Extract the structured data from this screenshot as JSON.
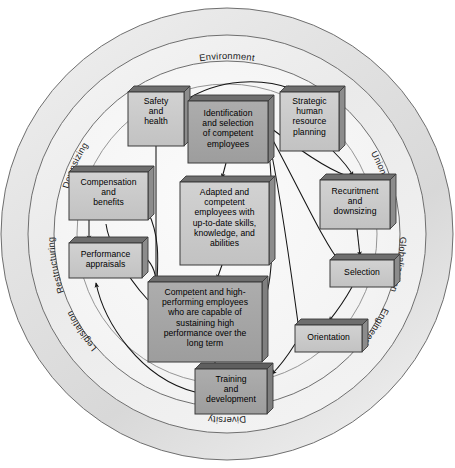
{
  "diagram": {
    "canvas": {
      "width": 455,
      "height": 468
    },
    "colors": {
      "outer_ring_fill": "#e2e2e2",
      "middle_ring_fill": "#ededed",
      "inner_disc_fill": "#f4f4f4",
      "ring_stroke": "#6f6f6f",
      "box_light_fill": "#c9c9c9",
      "box_dark_fill": "#a6a6a6",
      "box_stroke": "#3b3b3b",
      "box_top_face": "#707070",
      "arrow_stroke": "#1a1a1a",
      "text": "#000000",
      "background": "#ffffff"
    },
    "environment_ring": {
      "name": "environment-ring",
      "labels": [
        {
          "id": "environment",
          "text": "Environment",
          "angle_deg": 270,
          "orientation": "horizontal"
        },
        {
          "id": "unions",
          "text": "Unions",
          "angle_deg": 315,
          "orientation": "tangential"
        },
        {
          "id": "globalization",
          "text": "Globalization",
          "angle_deg": 0,
          "orientation": "tangential"
        },
        {
          "id": "engineering",
          "text": "Engineering",
          "angle_deg": 45,
          "orientation": "tangential"
        },
        {
          "id": "diversity",
          "text": "Diversity",
          "angle_deg": 90,
          "orientation": "horizontal"
        },
        {
          "id": "legislation",
          "text": "Legislation",
          "angle_deg": 135,
          "orientation": "tangential"
        },
        {
          "id": "restructuring",
          "text": "Restructuring",
          "angle_deg": 180,
          "orientation": "tangential"
        },
        {
          "id": "downsizing",
          "text": "Downsizing",
          "angle_deg": 225,
          "orientation": "tangential"
        }
      ]
    },
    "boxes": [
      {
        "id": "safety-and-health",
        "name": "box-safety-and-health",
        "lines": [
          "Safety",
          "and",
          "health"
        ],
        "style": "light",
        "x": 128,
        "y": 92,
        "w": 56,
        "h": 54
      },
      {
        "id": "identification-and-selection",
        "name": "box-identification-and-selection",
        "lines": [
          "Identification",
          "and selection",
          "of competent",
          "employees"
        ],
        "style": "dark",
        "x": 188,
        "y": 101,
        "w": 80,
        "h": 62
      },
      {
        "id": "strategic-hr-planning",
        "name": "box-strategic-human-resource-planning",
        "lines": [
          "Strategic",
          "human",
          "resource",
          "planning"
        ],
        "style": "light",
        "x": 280,
        "y": 92,
        "w": 59,
        "h": 59
      },
      {
        "id": "compensation-and-benefits",
        "name": "box-compensation-and-benefits",
        "lines": [
          "Compensation",
          "and",
          "benefits"
        ],
        "style": "light",
        "x": 69,
        "y": 172,
        "w": 79,
        "h": 48
      },
      {
        "id": "adapted-and-competent",
        "name": "box-adapted-and-competent-employees",
        "lines": [
          "Adapted and",
          "competent",
          "employees with",
          "up-to-date skills,",
          "knowledge, and",
          "abilities"
        ],
        "style": "light",
        "x": 180,
        "y": 182,
        "w": 89,
        "h": 83
      },
      {
        "id": "recruitment-and-downsizing",
        "name": "box-recuritment-and-downsizing",
        "lines": [
          "Recuritment",
          "and",
          "downsizing"
        ],
        "style": "light",
        "x": 320,
        "y": 180,
        "w": 70,
        "h": 49
      },
      {
        "id": "performance-appraisals",
        "name": "box-performance-appraisals",
        "lines": [
          "Performance",
          "appraisals"
        ],
        "style": "light",
        "x": 69,
        "y": 243,
        "w": 73,
        "h": 35
      },
      {
        "id": "selection",
        "name": "box-selection",
        "lines": [
          "Selection"
        ],
        "style": "light",
        "x": 330,
        "y": 260,
        "w": 64,
        "h": 27
      },
      {
        "id": "competent-high-performing",
        "name": "box-competent-and-high-performing-employees",
        "lines": [
          "Competent and high-",
          "performing employees",
          "who are capable of",
          "sustaining high",
          "performance over the",
          "long term"
        ],
        "style": "dark",
        "x": 148,
        "y": 282,
        "w": 114,
        "h": 80
      },
      {
        "id": "orientation",
        "name": "box-orientation",
        "lines": [
          "Orientation"
        ],
        "style": "light",
        "x": 295,
        "y": 325,
        "w": 67,
        "h": 27
      },
      {
        "id": "training-and-development",
        "name": "box-training-and-development",
        "lines": [
          "Training",
          "and",
          "development"
        ],
        "style": "dark",
        "x": 195,
        "y": 369,
        "w": 72,
        "h": 45
      }
    ],
    "connections": [
      {
        "id": "c1",
        "from": "safety-and-health",
        "to": "strategic-hr-planning",
        "arrow": true
      },
      {
        "id": "c2",
        "from": "strategic-hr-planning",
        "to": "recruitment-and-downsizing",
        "arrow": true
      },
      {
        "id": "c3",
        "from": "recruitment-and-downsizing",
        "to": "selection",
        "arrow": true
      },
      {
        "id": "c4",
        "from": "selection",
        "to": "orientation",
        "arrow": true
      },
      {
        "id": "c5",
        "from": "orientation",
        "to": "training-and-development",
        "arrow": true
      },
      {
        "id": "c6",
        "from": "identification-and-selection",
        "to": "adapted-and-competent",
        "arrow": true
      },
      {
        "id": "c7",
        "from": "adapted-and-competent",
        "to": "competent-high-performing",
        "arrow": true
      },
      {
        "id": "c8",
        "from": "compensation-and-benefits",
        "to": "performance-appraisals",
        "arrow": true
      },
      {
        "id": "c9",
        "from": "performance-appraisals",
        "to": "competent-high-performing",
        "arrow": true
      },
      {
        "id": "c10",
        "from": "training-and-development",
        "to": "performance-appraisals",
        "arrow": true
      },
      {
        "id": "c11",
        "from": "competent-high-performing",
        "to": "compensation-and-benefits",
        "arrow": true
      },
      {
        "id": "c12",
        "from": "safety-and-health",
        "to": "competent-high-performing",
        "arrow": true
      },
      {
        "id": "c13",
        "from": "identification-and-selection",
        "to": "safety-and-health",
        "arrow": true
      }
    ]
  }
}
